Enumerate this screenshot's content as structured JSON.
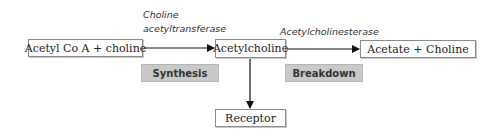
{
  "nodes": {
    "substrate": "Acetyl Co A + choline",
    "product": "Acetylcholine",
    "breakdown_products": "Acetate + Choline",
    "receptor": "Receptor"
  },
  "enzymes": {
    "synthesis_line1": "Choline",
    "synthesis_line2": "acetyltransferase",
    "breakdown": "Acetylcholinesterase"
  },
  "labels": {
    "synthesis": "Synthesis",
    "breakdown": "Breakdown"
  },
  "colors": {
    "tag_bg": "#c9c9c9",
    "arrow": "#111111"
  }
}
